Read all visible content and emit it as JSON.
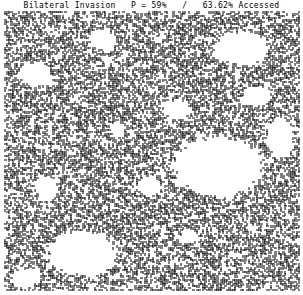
{
  "figure": {
    "title": "Bilateral Invasion   P = 59%   /   63.62% Accessed",
    "mode": "Bilateral Invasion",
    "probability": "P = 59%",
    "accessed": "63.62% Accessed",
    "colors": {
      "cluster": "#000000",
      "background": "#ffffff"
    },
    "voids": [
      {
        "cx": 0.72,
        "cy": 0.55,
        "rx": 0.17,
        "ry": 0.12
      },
      {
        "cx": 0.26,
        "cy": 0.86,
        "rx": 0.13,
        "ry": 0.09
      },
      {
        "cx": 0.8,
        "cy": 0.13,
        "rx": 0.1,
        "ry": 0.07
      },
      {
        "cx": 0.58,
        "cy": 0.35,
        "rx": 0.05,
        "ry": 0.04
      },
      {
        "cx": 0.1,
        "cy": 0.22,
        "rx": 0.06,
        "ry": 0.05
      },
      {
        "cx": 0.33,
        "cy": 0.1,
        "rx": 0.05,
        "ry": 0.04
      },
      {
        "cx": 0.93,
        "cy": 0.45,
        "rx": 0.05,
        "ry": 0.08
      },
      {
        "cx": 0.07,
        "cy": 0.95,
        "rx": 0.05,
        "ry": 0.04
      },
      {
        "cx": 0.49,
        "cy": 0.62,
        "rx": 0.04,
        "ry": 0.04
      },
      {
        "cx": 0.14,
        "cy": 0.63,
        "rx": 0.04,
        "ry": 0.05
      },
      {
        "cx": 0.85,
        "cy": 0.3,
        "rx": 0.05,
        "ry": 0.04
      },
      {
        "cx": 0.38,
        "cy": 0.42,
        "rx": 0.03,
        "ry": 0.03
      },
      {
        "cx": 0.62,
        "cy": 0.8,
        "rx": 0.03,
        "ry": 0.03
      }
    ]
  }
}
